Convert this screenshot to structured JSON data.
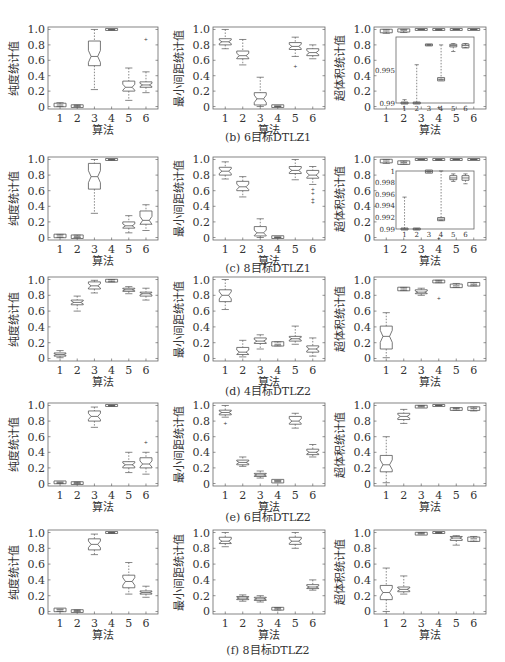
{
  "figure": {
    "x_label": "算法",
    "y_labels": [
      "纯度统计值",
      "最小间距统计值",
      "超体积统计值"
    ],
    "x_ticks": [
      "1",
      "2",
      "3",
      "4",
      "5",
      "6"
    ],
    "y_ticks": [
      "0",
      "0.2",
      "0.4",
      "0.6",
      "0.8",
      "1.0"
    ],
    "captions": [
      "(b) 6目标DTLZ1",
      "(c) 8目标DTLZ1",
      "(d) 4目标DTLZ2",
      "(e) 6目标DTLZ2",
      "(f) 8目标DTLZ2"
    ]
  },
  "chart_data": [
    {
      "type": "box",
      "row": 1,
      "col": 1,
      "problem": "6目标DTLZ1",
      "ylabel": "纯度统计值",
      "xlabel": "算法",
      "categories": [
        "1",
        "2",
        "3",
        "4",
        "5",
        "6"
      ],
      "ylim": [
        0,
        1
      ],
      "boxes": [
        {
          "min": 0.0,
          "q1": 0.01,
          "med": 0.02,
          "q3": 0.03,
          "max": 0.05
        },
        {
          "min": 0.0,
          "q1": 0.0,
          "med": 0.01,
          "q3": 0.01,
          "max": 0.02
        },
        {
          "min": 0.22,
          "q1": 0.53,
          "med": 0.65,
          "q3": 0.85,
          "max": 1.0
        },
        {
          "min": 0.99,
          "q1": 1.0,
          "med": 1.0,
          "q3": 1.0,
          "max": 1.0
        },
        {
          "min": 0.08,
          "q1": 0.2,
          "med": 0.25,
          "q3": 0.33,
          "max": 0.5
        },
        {
          "min": 0.18,
          "q1": 0.25,
          "med": 0.28,
          "q3": 0.32,
          "max": 0.45,
          "outliers": [
            0.88
          ]
        }
      ]
    },
    {
      "type": "box",
      "row": 1,
      "col": 2,
      "problem": "6目标DTLZ1",
      "ylabel": "最小间距统计值",
      "xlabel": "算法",
      "categories": [
        "1",
        "2",
        "3",
        "4",
        "5",
        "6"
      ],
      "ylim": [
        0,
        1
      ],
      "boxes": [
        {
          "min": 0.75,
          "q1": 0.8,
          "med": 0.84,
          "q3": 0.88,
          "max": 1.0
        },
        {
          "min": 0.54,
          "q1": 0.62,
          "med": 0.66,
          "q3": 0.72,
          "max": 0.87
        },
        {
          "min": 0.0,
          "q1": 0.02,
          "med": 0.1,
          "q3": 0.18,
          "max": 0.38
        },
        {
          "min": 0.0,
          "q1": 0.0,
          "med": 0.0,
          "q3": 0.01,
          "max": 0.01
        },
        {
          "min": 0.65,
          "q1": 0.74,
          "med": 0.78,
          "q3": 0.83,
          "max": 0.9,
          "outliers": [
            0.53
          ]
        },
        {
          "min": 0.62,
          "q1": 0.66,
          "med": 0.7,
          "q3": 0.75,
          "max": 0.8
        }
      ]
    },
    {
      "type": "box",
      "row": 1,
      "col": 3,
      "problem": "6目标DTLZ1",
      "ylabel": "超体积统计值",
      "xlabel": "算法",
      "categories": [
        "1",
        "2",
        "3",
        "4",
        "5",
        "6"
      ],
      "ylim": [
        0,
        1
      ],
      "boxes": [
        {
          "min": 0.95,
          "q1": 0.97,
          "med": 0.98,
          "q3": 0.99,
          "max": 1.0
        },
        {
          "min": 0.96,
          "q1": 0.98,
          "med": 0.99,
          "q3": 0.995,
          "max": 1.0
        },
        {
          "min": 1.0,
          "q1": 1.0,
          "med": 1.0,
          "q3": 1.0,
          "max": 1.0
        },
        {
          "min": 0.99,
          "q1": 1.0,
          "med": 1.0,
          "q3": 1.0,
          "max": 1.0,
          "outliers": [
            0.0
          ]
        },
        {
          "min": 1.0,
          "q1": 1.0,
          "med": 1.0,
          "q3": 1.0,
          "max": 1.0
        },
        {
          "min": 1.0,
          "q1": 1.0,
          "med": 1.0,
          "q3": 1.0,
          "max": 1.0
        }
      ],
      "inset": {
        "ylim": [
          0.99,
          1.0
        ],
        "yticks": [
          "0.99",
          "0.995"
        ],
        "boxes": [
          {
            "min": 0.99,
            "q1": 0.99,
            "med": 0.99,
            "q3": 0.99,
            "max": 0.9905
          },
          {
            "min": 0.99,
            "q1": 0.99,
            "med": 0.99,
            "q3": 0.99,
            "max": 0.9958
          },
          {
            "min": 0.9988,
            "q1": 0.9988,
            "med": 0.9988,
            "q3": 0.9988,
            "max": 0.9988
          },
          {
            "min": 0.9935,
            "q1": 0.9935,
            "med": 0.9936,
            "q3": 0.9937,
            "max": 0.9988
          },
          {
            "min": 0.9978,
            "q1": 0.9985,
            "med": 0.9987,
            "q3": 0.9989,
            "max": 0.999
          },
          {
            "min": 0.9984,
            "q1": 0.9985,
            "med": 0.9987,
            "q3": 0.9988,
            "max": 0.999
          }
        ]
      }
    },
    {
      "type": "box",
      "row": 2,
      "col": 1,
      "problem": "8目标DTLZ1",
      "ylabel": "纯度统计值",
      "xlabel": "算法",
      "categories": [
        "1",
        "2",
        "3",
        "4",
        "5",
        "6"
      ],
      "ylim": [
        0,
        1
      ],
      "boxes": [
        {
          "min": 0.0,
          "q1": 0.01,
          "med": 0.02,
          "q3": 0.03,
          "max": 0.04
        },
        {
          "min": 0.0,
          "q1": 0.0,
          "med": 0.01,
          "q3": 0.02,
          "max": 0.03
        },
        {
          "min": 0.31,
          "q1": 0.62,
          "med": 0.78,
          "q3": 0.95,
          "max": 1.0
        },
        {
          "min": 0.99,
          "q1": 1.0,
          "med": 1.0,
          "q3": 1.0,
          "max": 1.0
        },
        {
          "min": 0.06,
          "q1": 0.12,
          "med": 0.15,
          "q3": 0.2,
          "max": 0.28
        },
        {
          "min": 0.09,
          "q1": 0.17,
          "med": 0.22,
          "q3": 0.34,
          "max": 0.42
        }
      ]
    },
    {
      "type": "box",
      "row": 2,
      "col": 2,
      "problem": "8目标DTLZ1",
      "ylabel": "最小间距统计值",
      "xlabel": "算法",
      "categories": [
        "1",
        "2",
        "3",
        "4",
        "5",
        "6"
      ],
      "ylim": [
        0,
        1
      ],
      "boxes": [
        {
          "min": 0.75,
          "q1": 0.8,
          "med": 0.85,
          "q3": 0.9,
          "max": 0.97
        },
        {
          "min": 0.52,
          "q1": 0.6,
          "med": 0.65,
          "q3": 0.72,
          "max": 0.78
        },
        {
          "min": 0.0,
          "q1": 0.02,
          "med": 0.06,
          "q3": 0.14,
          "max": 0.24
        },
        {
          "min": 0.0,
          "q1": 0.0,
          "med": 0.0,
          "q3": 0.01,
          "max": 0.01
        },
        {
          "min": 0.74,
          "q1": 0.82,
          "med": 0.86,
          "q3": 0.91,
          "max": 1.0
        },
        {
          "min": 0.68,
          "q1": 0.76,
          "med": 0.8,
          "q3": 0.86,
          "max": 0.91,
          "outliers": [
            0.62,
            0.57,
            0.5,
            0.46
          ]
        }
      ]
    },
    {
      "type": "box",
      "row": 2,
      "col": 3,
      "problem": "8目标DTLZ1",
      "ylabel": "超体积统计值",
      "xlabel": "算法",
      "categories": [
        "1",
        "2",
        "3",
        "4",
        "5",
        "6"
      ],
      "ylim": [
        0,
        1
      ],
      "boxes": [
        {
          "min": 0.95,
          "q1": 0.97,
          "med": 0.98,
          "q3": 0.99,
          "max": 1.0
        },
        {
          "min": 0.94,
          "q1": 0.95,
          "med": 0.96,
          "q3": 0.97,
          "max": 0.98
        },
        {
          "min": 1.0,
          "q1": 1.0,
          "med": 1.0,
          "q3": 1.0,
          "max": 1.0
        },
        {
          "min": 0.99,
          "q1": 1.0,
          "med": 1.0,
          "q3": 1.0,
          "max": 1.0,
          "outliers": [
            0.0
          ]
        },
        {
          "min": 1.0,
          "q1": 1.0,
          "med": 1.0,
          "q3": 1.0,
          "max": 1.0
        },
        {
          "min": 1.0,
          "q1": 1.0,
          "med": 1.0,
          "q3": 1.0,
          "max": 1.0
        }
      ],
      "inset": {
        "ylim": [
          0.99,
          1.0
        ],
        "yticks": [
          "0.99",
          "0.992",
          "0.994",
          "0.996",
          "0.998",
          "1"
        ],
        "boxes": [
          {
            "min": 0.99,
            "q1": 0.99,
            "med": 0.99,
            "q3": 0.99,
            "max": 0.9955
          },
          {
            "min": 0.99,
            "q1": 0.99,
            "med": 0.99,
            "q3": 0.99,
            "max": 0.99
          },
          {
            "min": 0.9998,
            "q1": 0.9998,
            "med": 0.9999,
            "q3": 1.0,
            "max": 1.0
          },
          {
            "min": 0.9915,
            "q1": 0.9916,
            "med": 0.9917,
            "q3": 0.9918,
            "max": 1.0
          },
          {
            "min": 0.9982,
            "q1": 0.9985,
            "med": 0.9988,
            "q3": 0.9992,
            "max": 0.9995
          },
          {
            "min": 0.9978,
            "q1": 0.9984,
            "med": 0.9988,
            "q3": 0.9992,
            "max": 0.9995
          }
        ]
      }
    },
    {
      "type": "box",
      "row": 3,
      "col": 1,
      "problem": "4目标DTLZ2",
      "ylabel": "纯度统计值",
      "xlabel": "算法",
      "categories": [
        "1",
        "2",
        "3",
        "4",
        "5",
        "6"
      ],
      "ylim": [
        0,
        1
      ],
      "boxes": [
        {
          "min": 0.01,
          "q1": 0.03,
          "med": 0.05,
          "q3": 0.07,
          "max": 0.1
        },
        {
          "min": 0.6,
          "q1": 0.68,
          "med": 0.71,
          "q3": 0.74,
          "max": 0.79
        },
        {
          "min": 0.83,
          "q1": 0.88,
          "med": 0.92,
          "q3": 0.97,
          "max": 0.99
        },
        {
          "min": 0.97,
          "q1": 0.98,
          "med": 0.98,
          "q3": 0.99,
          "max": 1.0
        },
        {
          "min": 0.82,
          "q1": 0.85,
          "med": 0.87,
          "q3": 0.89,
          "max": 0.91
        },
        {
          "min": 0.74,
          "q1": 0.79,
          "med": 0.82,
          "q3": 0.84,
          "max": 0.89
        }
      ]
    },
    {
      "type": "box",
      "row": 3,
      "col": 2,
      "problem": "4目标DTLZ2",
      "ylabel": "最小间距统计值",
      "xlabel": "算法",
      "categories": [
        "1",
        "2",
        "3",
        "4",
        "5",
        "6"
      ],
      "ylim": [
        0,
        1
      ],
      "boxes": [
        {
          "min": 0.62,
          "q1": 0.72,
          "med": 0.8,
          "q3": 0.87,
          "max": 1.0
        },
        {
          "min": 0.02,
          "q1": 0.05,
          "med": 0.08,
          "q3": 0.14,
          "max": 0.23
        },
        {
          "min": 0.12,
          "q1": 0.19,
          "med": 0.22,
          "q3": 0.26,
          "max": 0.3
        },
        {
          "min": 0.16,
          "q1": 0.17,
          "med": 0.18,
          "q3": 0.2,
          "max": 0.21
        },
        {
          "min": 0.18,
          "q1": 0.22,
          "med": 0.25,
          "q3": 0.28,
          "max": 0.41
        },
        {
          "min": 0.03,
          "q1": 0.08,
          "med": 0.12,
          "q3": 0.16,
          "max": 0.26
        }
      ]
    },
    {
      "type": "box",
      "row": 3,
      "col": 3,
      "problem": "4目标DTLZ2",
      "ylabel": "超体积统计值",
      "xlabel": "算法",
      "categories": [
        "1",
        "2",
        "3",
        "4",
        "5",
        "6"
      ],
      "ylim": [
        0,
        1
      ],
      "boxes": [
        {
          "min": 0.01,
          "q1": 0.12,
          "med": 0.28,
          "q3": 0.41,
          "max": 0.58
        },
        {
          "min": 0.86,
          "q1": 0.87,
          "med": 0.88,
          "q3": 0.89,
          "max": 0.9
        },
        {
          "min": 0.8,
          "q1": 0.82,
          "med": 0.84,
          "q3": 0.87,
          "max": 0.89
        },
        {
          "min": 0.96,
          "q1": 0.97,
          "med": 0.98,
          "q3": 0.98,
          "max": 0.99,
          "outliers": [
            0.76
          ]
        },
        {
          "min": 0.9,
          "q1": 0.91,
          "med": 0.92,
          "q3": 0.93,
          "max": 0.95
        },
        {
          "min": 0.92,
          "q1": 0.93,
          "med": 0.94,
          "q3": 0.95,
          "max": 0.96
        }
      ]
    },
    {
      "type": "box",
      "row": 4,
      "col": 1,
      "problem": "6目标DTLZ2",
      "ylabel": "纯度统计值",
      "xlabel": "算法",
      "categories": [
        "1",
        "2",
        "3",
        "4",
        "5",
        "6"
      ],
      "ylim": [
        0,
        1
      ],
      "boxes": [
        {
          "min": 0.0,
          "q1": 0.01,
          "med": 0.01,
          "q3": 0.02,
          "max": 0.02
        },
        {
          "min": 0.0,
          "q1": 0.0,
          "med": 0.01,
          "q3": 0.01,
          "max": 0.02
        },
        {
          "min": 0.72,
          "q1": 0.8,
          "med": 0.86,
          "q3": 0.93,
          "max": 0.98
        },
        {
          "min": 0.99,
          "q1": 1.0,
          "med": 1.0,
          "q3": 1.0,
          "max": 1.0
        },
        {
          "min": 0.14,
          "q1": 0.2,
          "med": 0.24,
          "q3": 0.28,
          "max": 0.4
        },
        {
          "min": 0.12,
          "q1": 0.2,
          "med": 0.25,
          "q3": 0.33,
          "max": 0.4,
          "outliers": [
            0.53
          ]
        }
      ]
    },
    {
      "type": "box",
      "row": 4,
      "col": 2,
      "problem": "6目标DTLZ2",
      "ylabel": "最小间距统计值",
      "xlabel": "算法",
      "categories": [
        "1",
        "2",
        "3",
        "4",
        "5",
        "6"
      ],
      "ylim": [
        0,
        1
      ],
      "boxes": [
        {
          "min": 0.85,
          "q1": 0.88,
          "med": 0.91,
          "q3": 0.94,
          "max": 1.0,
          "outliers": [
            0.77
          ]
        },
        {
          "min": 0.22,
          "q1": 0.24,
          "med": 0.27,
          "q3": 0.3,
          "max": 0.34
        },
        {
          "min": 0.07,
          "q1": 0.09,
          "med": 0.11,
          "q3": 0.13,
          "max": 0.16
        },
        {
          "min": 0.02,
          "q1": 0.02,
          "med": 0.03,
          "q3": 0.04,
          "max": 0.04
        },
        {
          "min": 0.71,
          "q1": 0.76,
          "med": 0.8,
          "q3": 0.86,
          "max": 0.9
        },
        {
          "min": 0.34,
          "q1": 0.37,
          "med": 0.4,
          "q3": 0.44,
          "max": 0.5
        }
      ]
    },
    {
      "type": "box",
      "row": 4,
      "col": 3,
      "problem": "6目标DTLZ2",
      "ylabel": "超体积统计值",
      "xlabel": "算法",
      "categories": [
        "1",
        "2",
        "3",
        "4",
        "5",
        "6"
      ],
      "ylim": [
        0,
        1
      ],
      "boxes": [
        {
          "min": 0.01,
          "q1": 0.15,
          "med": 0.24,
          "q3": 0.36,
          "max": 0.6
        },
        {
          "min": 0.77,
          "q1": 0.82,
          "med": 0.86,
          "q3": 0.9,
          "max": 0.95
        },
        {
          "min": 0.98,
          "q1": 0.98,
          "med": 0.99,
          "q3": 0.99,
          "max": 1.0
        },
        {
          "min": 1.0,
          "q1": 1.0,
          "med": 1.0,
          "q3": 1.0,
          "max": 1.0
        },
        {
          "min": 0.94,
          "q1": 0.95,
          "med": 0.96,
          "q3": 0.96,
          "max": 0.97
        },
        {
          "min": 0.93,
          "q1": 0.95,
          "med": 0.96,
          "q3": 0.97,
          "max": 0.98
        }
      ]
    },
    {
      "type": "box",
      "row": 5,
      "col": 1,
      "problem": "8目标DTLZ2",
      "ylabel": "纯度统计值",
      "xlabel": "算法",
      "categories": [
        "1",
        "2",
        "3",
        "4",
        "5",
        "6"
      ],
      "ylim": [
        0,
        1
      ],
      "boxes": [
        {
          "min": 0.0,
          "q1": 0.01,
          "med": 0.02,
          "q3": 0.03,
          "max": 0.03
        },
        {
          "min": 0.0,
          "q1": 0.0,
          "med": 0.01,
          "q3": 0.01,
          "max": 0.02
        },
        {
          "min": 0.72,
          "q1": 0.78,
          "med": 0.85,
          "q3": 0.92,
          "max": 0.98
        },
        {
          "min": 0.99,
          "q1": 1.0,
          "med": 1.0,
          "q3": 1.0,
          "max": 1.0
        },
        {
          "min": 0.22,
          "q1": 0.3,
          "med": 0.38,
          "q3": 0.46,
          "max": 0.62
        },
        {
          "min": 0.18,
          "q1": 0.22,
          "med": 0.24,
          "q3": 0.26,
          "max": 0.32
        }
      ]
    },
    {
      "type": "box",
      "row": 5,
      "col": 2,
      "problem": "8目标DTLZ2",
      "ylabel": "最小间距统计值",
      "xlabel": "算法",
      "categories": [
        "1",
        "2",
        "3",
        "4",
        "5",
        "6"
      ],
      "ylim": [
        0,
        1
      ],
      "boxes": [
        {
          "min": 0.82,
          "q1": 0.86,
          "med": 0.89,
          "q3": 0.94,
          "max": 1.0
        },
        {
          "min": 0.13,
          "q1": 0.15,
          "med": 0.17,
          "q3": 0.19,
          "max": 0.21
        },
        {
          "min": 0.12,
          "q1": 0.14,
          "med": 0.16,
          "q3": 0.18,
          "max": 0.2
        },
        {
          "min": 0.02,
          "q1": 0.03,
          "med": 0.04,
          "q3": 0.04,
          "max": 0.05
        },
        {
          "min": 0.8,
          "q1": 0.85,
          "med": 0.89,
          "q3": 0.94,
          "max": 1.0
        },
        {
          "min": 0.27,
          "q1": 0.29,
          "med": 0.31,
          "q3": 0.34,
          "max": 0.4
        }
      ]
    },
    {
      "type": "box",
      "row": 5,
      "col": 3,
      "problem": "8目标DTLZ2",
      "ylabel": "超体积统计值",
      "xlabel": "算法",
      "categories": [
        "1",
        "2",
        "3",
        "4",
        "5",
        "6"
      ],
      "ylim": [
        0,
        1
      ],
      "boxes": [
        {
          "min": 0.0,
          "q1": 0.15,
          "med": 0.24,
          "q3": 0.33,
          "max": 0.55
        },
        {
          "min": 0.22,
          "q1": 0.25,
          "med": 0.28,
          "q3": 0.31,
          "max": 0.45
        },
        {
          "min": 0.98,
          "q1": 0.98,
          "med": 0.99,
          "q3": 0.99,
          "max": 1.0
        },
        {
          "min": 0.99,
          "q1": 1.0,
          "med": 1.0,
          "q3": 1.0,
          "max": 1.0
        },
        {
          "min": 0.84,
          "q1": 0.9,
          "med": 0.93,
          "q3": 0.95,
          "max": 0.96
        },
        {
          "min": 0.89,
          "q1": 0.9,
          "med": 0.92,
          "q3": 0.93,
          "max": 0.95
        }
      ]
    }
  ]
}
